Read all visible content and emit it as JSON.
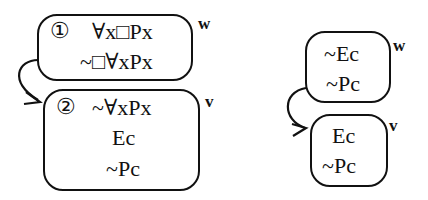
{
  "left_tree": {
    "world_w": {
      "label": "w",
      "number": "①",
      "lines": [
        "∀x□Px",
        "~□∀xPx"
      ]
    },
    "world_v": {
      "label": "v",
      "number": "②",
      "lines": [
        "~∀xPx",
        "Ec",
        "~Pc"
      ]
    }
  },
  "right_tree": {
    "world_w": {
      "label": "w",
      "lines": [
        "~Ec",
        "~Pc"
      ]
    },
    "world_v": {
      "label": "v",
      "lines": [
        "Ec",
        "~Pc"
      ]
    }
  }
}
